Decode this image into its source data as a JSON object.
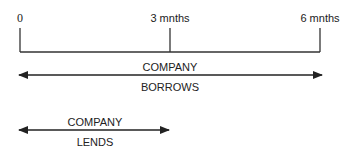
{
  "timeline": {
    "ticks": [
      {
        "label": "0",
        "x": 20
      },
      {
        "label": "3 mnths",
        "x": 170
      },
      {
        "label": "6 mnths",
        "x": 320
      }
    ]
  },
  "arrows": {
    "borrow": {
      "top_label": "COMPANY",
      "bottom_label": "BORROWS",
      "x1": 17,
      "x2": 323
    },
    "lend": {
      "top_label": "COMPANY",
      "bottom_label": "LENDS",
      "x1": 17,
      "x2": 170
    }
  },
  "colors": {
    "line": "#333333",
    "text": "#222222"
  }
}
